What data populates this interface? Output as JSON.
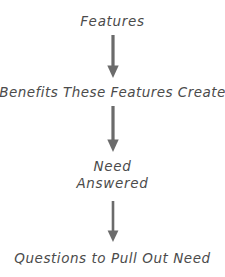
{
  "diagram": {
    "background_color": "#ffffff",
    "text_color": "#4b4b4b",
    "arrow_color": "#6b6b6b",
    "nodes": [
      {
        "id": "features",
        "label": "Features"
      },
      {
        "id": "benefits",
        "label": "Benefits These Features Create"
      },
      {
        "id": "need",
        "label_line1": "Need",
        "label_line2": "Answered"
      },
      {
        "id": "questions",
        "label": "Questions to Pull Out Need"
      }
    ],
    "arrows": [
      {
        "id": "arrow-features-to-benefits",
        "direction": "down"
      },
      {
        "id": "arrow-benefits-to-need",
        "direction": "down"
      },
      {
        "id": "arrow-need-to-questions",
        "direction": "down"
      }
    ]
  }
}
